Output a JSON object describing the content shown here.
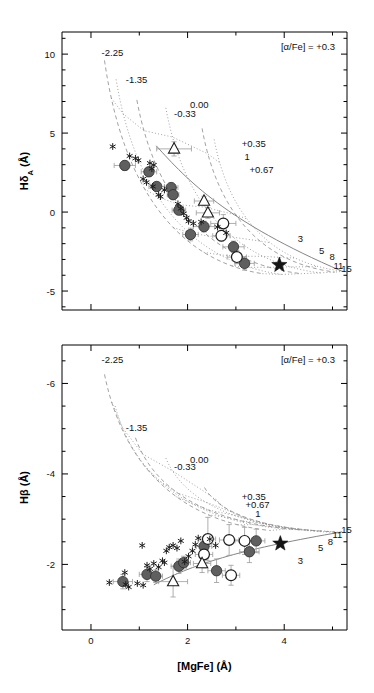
{
  "figure": {
    "xlabel": "[MgFe] (Å)",
    "background": "#ffffff",
    "foreground": "#111111"
  },
  "panels": [
    {
      "id": "top",
      "ylabel": "HδA (Å)",
      "ylabel_parts": {
        "main": "Hδ",
        "sub": "A",
        "unit": " (Å)"
      },
      "annotation": "[α/Fe] = +0.3",
      "xticks": [
        0,
        2,
        4
      ],
      "xtick_labels": [
        "0",
        "2",
        "4"
      ],
      "xlim": [
        -0.6,
        5.3
      ],
      "yticks": [
        10,
        5,
        0,
        -5
      ],
      "ytick_labels": [
        "10",
        "5",
        "0",
        "-5"
      ],
      "ylim": [
        -6.2,
        11.4
      ],
      "metallicity_labels": [
        {
          "text": "-2.25",
          "x": 0.22,
          "y": 9.9
        },
        {
          "text": "-1.35",
          "x": 0.72,
          "y": 8.2
        },
        {
          "text": "0.00",
          "x": 2.05,
          "y": 6.6
        },
        {
          "text": "-0.33",
          "x": 1.72,
          "y": 6.0
        },
        {
          "text": "+0.35",
          "x": 3.12,
          "y": 4.1
        },
        {
          "text": "+0.67",
          "x": 3.28,
          "y": 2.5
        }
      ],
      "age_labels": [
        {
          "text": "1",
          "x": 3.18,
          "y": 3.3
        },
        {
          "text": "3",
          "x": 4.28,
          "y": -1.9
        },
        {
          "text": "5",
          "x": 4.72,
          "y": -2.65
        },
        {
          "text": "8",
          "x": 4.94,
          "y": -3.05
        },
        {
          "text": "11",
          "x": 5.02,
          "y": -3.62
        },
        {
          "text": "15",
          "x": 5.18,
          "y": -3.78
        }
      ]
    },
    {
      "id": "bottom",
      "ylabel": "Hβ (Å)",
      "ylabel_parts": {
        "main": "Hβ",
        "sub": "",
        "unit": " (Å)"
      },
      "annotation": "[α/Fe] = +0.3",
      "xticks": [
        0,
        2,
        4
      ],
      "xtick_labels": [
        "0",
        "2",
        "4"
      ],
      "xlim": [
        -0.6,
        5.3
      ],
      "yticks": [
        -6,
        -4,
        -2
      ],
      "ytick_labels": [
        "-6",
        "-4",
        "-2"
      ],
      "ylim": [
        -6.85,
        -0.55
      ],
      "y_inverted": true,
      "metallicity_labels": [
        {
          "text": "-2.25",
          "x": 0.22,
          "y": -6.45
        },
        {
          "text": "-1.35",
          "x": 0.72,
          "y": -4.95
        },
        {
          "text": "0.00",
          "x": 2.05,
          "y": -4.25
        },
        {
          "text": "-0.33",
          "x": 1.72,
          "y": -4.08
        },
        {
          "text": "+0.35",
          "x": 3.12,
          "y": -3.42
        },
        {
          "text": "+0.67",
          "x": 3.2,
          "y": -3.24
        }
      ],
      "age_labels": [
        {
          "text": "1",
          "x": 3.4,
          "y": -3.04
        },
        {
          "text": "3",
          "x": 4.28,
          "y": -2.0
        },
        {
          "text": "5",
          "x": 4.7,
          "y": -2.3
        },
        {
          "text": "8",
          "x": 4.9,
          "y": -2.43
        },
        {
          "text": "11",
          "x": 5.0,
          "y": -2.58
        },
        {
          "text": "15",
          "x": 5.18,
          "y": -2.7
        }
      ]
    }
  ],
  "chart_data": {
    "type": "scatter",
    "title": "",
    "xlabel": "[MgFe] (Å)",
    "legend": [
      {
        "symbol": "filled-circle",
        "name": "filled grey circles"
      },
      {
        "symbol": "open-circle",
        "name": "open circles"
      },
      {
        "symbol": "open-triangle",
        "name": "open triangles"
      },
      {
        "symbol": "asterisk",
        "name": "asterisks"
      },
      {
        "symbol": "star",
        "name": "filled star"
      }
    ],
    "panels": [
      {
        "id": "top",
        "ylabel": "HδA (Å)",
        "xlim": [
          -0.6,
          5.3
        ],
        "ylim": [
          -6.2,
          11.4
        ],
        "series": [
          {
            "name": "filled-circle",
            "points": [
              {
                "x": 0.7,
                "y": 2.95,
                "xerr": 0.22,
                "yerr": 0.3
              },
              {
                "x": 1.2,
                "y": 2.55,
                "xerr": 0.16,
                "yerr": 0.26
              },
              {
                "x": 1.36,
                "y": 1.62,
                "xerr": 0.16,
                "yerr": 0.26
              },
              {
                "x": 1.66,
                "y": 1.55,
                "xerr": 0.14,
                "yerr": 0.3
              },
              {
                "x": 1.7,
                "y": 1.1,
                "xerr": 0.12,
                "yerr": 0.26
              },
              {
                "x": 1.82,
                "y": 0.12,
                "xerr": 0.14,
                "yerr": 0.26
              },
              {
                "x": 2.06,
                "y": -1.42,
                "xerr": 0.16,
                "yerr": 0.4
              },
              {
                "x": 2.34,
                "y": -0.92,
                "xerr": 0.22,
                "yerr": 0.34
              },
              {
                "x": 2.95,
                "y": -2.2,
                "xerr": 0.22,
                "yerr": 0.36
              },
              {
                "x": 3.18,
                "y": -3.25,
                "xerr": 0.2,
                "yerr": 0.42
              }
            ]
          },
          {
            "name": "open-circle",
            "points": [
              {
                "x": 2.74,
                "y": -0.72,
                "xerr": 0.26,
                "yerr": 0.56
              },
              {
                "x": 2.7,
                "y": -1.5,
                "xerr": 0.18,
                "yerr": 0.34
              },
              {
                "x": 3.02,
                "y": -2.85,
                "xerr": 0.2,
                "yerr": 0.42
              }
            ]
          },
          {
            "name": "open-triangle",
            "points": [
              {
                "x": 1.72,
                "y": 4.0,
                "xerr": 0.36,
                "yerr": 0.45
              },
              {
                "x": 2.34,
                "y": 0.7,
                "xerr": 0.2,
                "yerr": 0.3
              },
              {
                "x": 2.42,
                "y": -0.05,
                "xerr": 0.24,
                "yerr": 0.34
              }
            ]
          },
          {
            "name": "asterisk",
            "points": [
              {
                "x": 0.45,
                "y": 4.15
              },
              {
                "x": 0.8,
                "y": 3.55
              },
              {
                "x": 0.92,
                "y": 3.4
              },
              {
                "x": 0.98,
                "y": 3.28
              },
              {
                "x": 1.22,
                "y": 3.1
              },
              {
                "x": 1.3,
                "y": 2.98
              },
              {
                "x": 1.26,
                "y": 2.75
              },
              {
                "x": 1.08,
                "y": 2.1
              },
              {
                "x": 1.15,
                "y": 1.88
              },
              {
                "x": 1.28,
                "y": 1.62
              },
              {
                "x": 1.4,
                "y": 1.1
              },
              {
                "x": 1.44,
                "y": 0.98
              },
              {
                "x": 1.52,
                "y": 1.4
              },
              {
                "x": 1.8,
                "y": 0.52
              },
              {
                "x": 1.86,
                "y": 0.22
              },
              {
                "x": 1.92,
                "y": -0.1
              },
              {
                "x": 1.98,
                "y": -0.36
              },
              {
                "x": 2.02,
                "y": -0.58
              },
              {
                "x": 2.12,
                "y": -0.72
              },
              {
                "x": 2.28,
                "y": -0.62
              },
              {
                "x": 2.62,
                "y": -0.95
              },
              {
                "x": 2.8,
                "y": -1.32
              }
            ]
          },
          {
            "name": "star",
            "points": [
              {
                "x": 3.9,
                "y": -3.35
              }
            ]
          }
        ],
        "model_grid": {
          "metallicities": [
            -2.25,
            -1.35,
            -0.33,
            0.0,
            0.35,
            0.67
          ],
          "ages_gyr": [
            1,
            3,
            5,
            8,
            11,
            15
          ]
        }
      },
      {
        "id": "bottom",
        "ylabel": "Hβ (Å)",
        "xlim": [
          -0.6,
          5.3
        ],
        "ylim": [
          -6.85,
          -0.55
        ],
        "series": [
          {
            "name": "filled-circle",
            "points": [
              {
                "x": 0.66,
                "y": -1.62,
                "xerr": 0.2,
                "yerr": 0.16
              },
              {
                "x": 1.16,
                "y": -1.78,
                "xerr": 0.16,
                "yerr": 0.16
              },
              {
                "x": 1.34,
                "y": -1.74,
                "xerr": 0.14,
                "yerr": 0.14
              },
              {
                "x": 1.82,
                "y": -1.96,
                "xerr": 0.16,
                "yerr": 0.16
              },
              {
                "x": 1.92,
                "y": -2.04,
                "xerr": 0.14,
                "yerr": 0.14
              },
              {
                "x": 2.34,
                "y": -2.4,
                "xerr": 0.16,
                "yerr": 0.2
              },
              {
                "x": 2.6,
                "y": -1.86,
                "xerr": 0.18,
                "yerr": 0.26
              },
              {
                "x": 3.28,
                "y": -2.28,
                "xerr": 0.2,
                "yerr": 0.24
              },
              {
                "x": 3.42,
                "y": -2.52,
                "xerr": 0.18,
                "yerr": 0.26
              }
            ]
          },
          {
            "name": "open-circle",
            "points": [
              {
                "x": 2.34,
                "y": -2.22,
                "xerr": 0.18,
                "yerr": 0.3
              },
              {
                "x": 2.42,
                "y": -2.56,
                "xerr": 0.16,
                "yerr": 0.48
              },
              {
                "x": 2.9,
                "y": -1.76,
                "xerr": 0.18,
                "yerr": 0.22
              },
              {
                "x": 2.86,
                "y": -2.54,
                "xerr": 0.2,
                "yerr": 0.34
              },
              {
                "x": 3.18,
                "y": -2.52,
                "xerr": 0.2,
                "yerr": 0.3
              }
            ]
          },
          {
            "name": "open-triangle",
            "points": [
              {
                "x": 1.7,
                "y": -1.62,
                "xerr": 0.3,
                "yerr": 0.34
              },
              {
                "x": 2.3,
                "y": -2.02,
                "xerr": 0.18,
                "yerr": 0.2
              }
            ]
          },
          {
            "name": "asterisk",
            "points": [
              {
                "x": 0.38,
                "y": -1.6
              },
              {
                "x": 0.72,
                "y": -1.56
              },
              {
                "x": 0.78,
                "y": -1.5
              },
              {
                "x": 0.7,
                "y": -1.82
              },
              {
                "x": 0.96,
                "y": -1.58
              },
              {
                "x": 1.08,
                "y": -1.54
              },
              {
                "x": 1.16,
                "y": -1.98
              },
              {
                "x": 1.22,
                "y": -1.9
              },
              {
                "x": 1.3,
                "y": -2.02
              },
              {
                "x": 1.06,
                "y": -2.42
              },
              {
                "x": 1.4,
                "y": -1.94
              },
              {
                "x": 1.48,
                "y": -2.08
              },
              {
                "x": 1.52,
                "y": -2.04
              },
              {
                "x": 1.56,
                "y": -2.3
              },
              {
                "x": 1.62,
                "y": -2.38
              },
              {
                "x": 1.7,
                "y": -2.42
              },
              {
                "x": 1.78,
                "y": -2.36
              },
              {
                "x": 1.86,
                "y": -2.52
              },
              {
                "x": 1.94,
                "y": -2.06
              },
              {
                "x": 2.02,
                "y": -2.18
              },
              {
                "x": 2.1,
                "y": -2.3
              },
              {
                "x": 2.16,
                "y": -2.44
              },
              {
                "x": 2.22,
                "y": -2.58
              },
              {
                "x": 2.46,
                "y": -2.56
              },
              {
                "x": 2.58,
                "y": -2.42
              }
            ]
          },
          {
            "name": "star",
            "points": [
              {
                "x": 3.92,
                "y": -2.46
              }
            ]
          }
        ],
        "model_grid": {
          "metallicities": [
            -2.25,
            -1.35,
            -0.33,
            0.0,
            0.35,
            0.67
          ],
          "ages_gyr": [
            1,
            3,
            5,
            8,
            11,
            15
          ]
        }
      }
    ]
  }
}
